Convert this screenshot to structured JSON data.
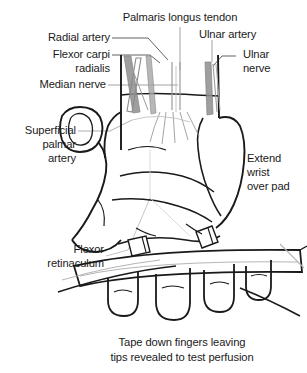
{
  "figure": {
    "kind": "medical-illustration",
    "background_color": "#ffffff",
    "ink_color": "#1a1a1a",
    "tendon_fill": "#8c8c8c",
    "artery_fill": "#a0a0a0",
    "light_line_color": "#b0b0b0"
  },
  "labels": {
    "radial_artery": "Radial artery",
    "flexor_carpi_radialis_line1": "Flexor carpi",
    "flexor_carpi_radialis_line2": "radialis",
    "median_nerve": "Median nerve",
    "palmaris_longus_tendon": "Palmaris longus tendon",
    "ulnar_artery": "Ulnar artery",
    "ulnar_nerve_line1": "Ulnar",
    "ulnar_nerve_line2": "nerve",
    "superficial_palmar_artery_line1": "Superficial",
    "superficial_palmar_artery_line2": "palmar",
    "superficial_palmar_artery_line3": "artery",
    "extend_wrist_line1": "Extend",
    "extend_wrist_line2": "wrist",
    "extend_wrist_line3": "over pad",
    "flexor_retinaculum_line1": "Flexor",
    "flexor_retinaculum_line2": "retinaculum"
  },
  "caption": {
    "line1": "Tape down fingers leaving",
    "line2": "tips revealed to test perfusion"
  }
}
